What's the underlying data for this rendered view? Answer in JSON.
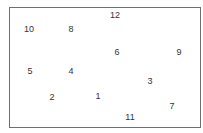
{
  "labels": [
    {
      "text": "12",
      "x": 115,
      "y": 15
    },
    {
      "text": "10",
      "x": 29,
      "y": 29
    },
    {
      "text": "8",
      "x": 71,
      "y": 29
    },
    {
      "text": "6",
      "x": 117,
      "y": 52
    },
    {
      "text": "9",
      "x": 179,
      "y": 52
    },
    {
      "text": "5",
      "x": 30,
      "y": 71
    },
    {
      "text": "4",
      "x": 71,
      "y": 71
    },
    {
      "text": "3",
      "x": 150,
      "y": 81
    },
    {
      "text": "2",
      "x": 52,
      "y": 97
    },
    {
      "text": "1",
      "x": 98,
      "y": 96
    },
    {
      "text": "7",
      "x": 172,
      "y": 106
    },
    {
      "text": "11",
      "x": 130,
      "y": 117
    }
  ]
}
